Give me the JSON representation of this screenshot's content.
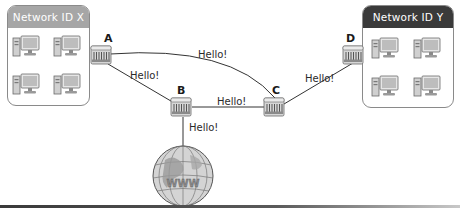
{
  "diagram": {
    "type": "network-topology",
    "networks": [
      {
        "id": "x",
        "title": "Network ID X",
        "header_color": "#a6a6a6",
        "computers": 4
      },
      {
        "id": "y",
        "title": "Network ID Y",
        "header_color": "#3a3a3a",
        "computers": 4
      }
    ],
    "routers": [
      {
        "id": "A",
        "label": "A"
      },
      {
        "id": "B",
        "label": "B"
      },
      {
        "id": "C",
        "label": "C"
      },
      {
        "id": "D",
        "label": "D"
      }
    ],
    "links": [
      {
        "from": "A",
        "to": "C",
        "label": "Hello!",
        "style": "curve"
      },
      {
        "from": "A",
        "to": "B",
        "label": "Hello!"
      },
      {
        "from": "B",
        "to": "C",
        "label": "Hello!"
      },
      {
        "from": "C",
        "to": "D",
        "label": "Hello!"
      },
      {
        "from": "B",
        "to": "Internet",
        "label": "Hello!"
      }
    ],
    "internet": {
      "label": "WWW",
      "icon": "globe-icon"
    }
  }
}
